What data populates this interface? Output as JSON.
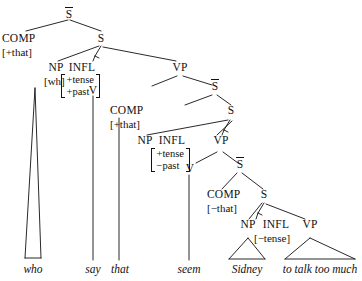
{
  "figure": {
    "background_color": "#ffffff",
    "line_color": "#111111",
    "text_color": "#111111"
  },
  "nodes": {
    "sbar_root": {
      "label": "S",
      "bar": true
    },
    "comp1": {
      "label": "COMP"
    },
    "comp1_feat": {
      "label": "[+that]"
    },
    "s1": {
      "label": "S"
    },
    "np1": {
      "label": "NP"
    },
    "np1_feat": {
      "label": "[wh]"
    },
    "infl1": {
      "label": "INFL"
    },
    "infl1_feat_row1": {
      "label": "+tense"
    },
    "infl1_feat_row2": {
      "label": "+past"
    },
    "vp1": {
      "label": "VP"
    },
    "v1": {
      "label": "V"
    },
    "sbar2": {
      "label": "S",
      "bar": true
    },
    "comp2": {
      "label": "COMP"
    },
    "comp2_feat": {
      "label": "[+that]"
    },
    "s2": {
      "label": "S"
    },
    "np2": {
      "label": "NP"
    },
    "infl2": {
      "label": "INFL"
    },
    "infl2_feat_row1": {
      "label": "+tense"
    },
    "infl2_feat_row2": {
      "label": "−past"
    },
    "vp2": {
      "label": "VP"
    },
    "v2": {
      "label": "V"
    },
    "sbar3": {
      "label": "S",
      "bar": true
    },
    "comp3": {
      "label": "COMP"
    },
    "comp3_feat": {
      "label": "[−that]"
    },
    "s3": {
      "label": "S"
    },
    "np3": {
      "label": "NP"
    },
    "infl3": {
      "label": "INFL"
    },
    "infl3_feat": {
      "label": "[−tense]"
    },
    "vp3": {
      "label": "VP"
    }
  },
  "terminals": [
    {
      "id": "who",
      "label": "who"
    },
    {
      "id": "say",
      "label": "say"
    },
    {
      "id": "that",
      "label": "that"
    },
    {
      "id": "seem",
      "label": "seem"
    },
    {
      "id": "sidney",
      "label": "Sidney"
    },
    {
      "id": "totalktoomuch",
      "label": "to talk too much"
    }
  ]
}
